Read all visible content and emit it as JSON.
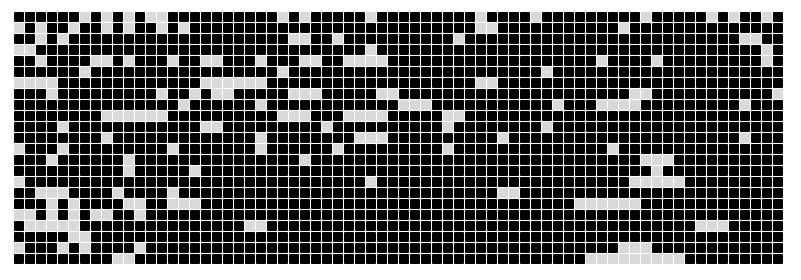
{
  "board": {
    "columns": 70,
    "rows": 23,
    "cell_size_px": 10,
    "gap_px": 1,
    "colors": {
      "on": "#000000",
      "off": "#d9d9d9",
      "background": "#ffffff"
    },
    "cells": [
      "1111110101010011111111110101111101111111110111101111111110111110101101",
      "0101101101011010111111111111111111111111110011111111111011111111111111",
      "1101011111111111111111111001101111111111011111111111111111111111110011",
      "0011111111111111111111111111111101111111111111111111111111111111111101",
      "1101111001011101100111011100110000111111111111111111101111011111111101",
      "1111110111111111111111110111111111111111111111110111111111111111111111",
      "0000111111111111100000011111111111111111110011111111111111111111111111",
      "1110111111111011010011111000111110011111111111111111111100111111111110",
      "1111111111111110111111011111111111100011111111111011100001111111110111",
      "1111111100000011111111110001110000111110011111111111111111111111111111",
      "1111011111111111100111111111011111111110111111110111111111111111111111",
      "1111111101111111111111011111111000111111111101111111111111111111110111",
      "0111011111111101111111011111101111111110111111111111110111111111111111",
      "1110111111011111111111111101111111111111111111111111111110001111111111",
      "1111111111011111011111111111111111111111111111111111111111011111111111",
      "0111111111111111111111111111111101111111111111111111111100000111111111",
      "1100011110111101111111111111111111111111111100111111111111111111111111",
      "1110101111001100011111111111111111111111111111111110000001111111111111",
      "0010101001101111111111111111111111111111111111111111111111111111111111",
      "1000001111111111111110011111111111111111111111111111111111111100011111",
      "1111100111111111111111111111111111111111111111111111111111111111111111",
      "0111010111101111111111111111111111111111111111111111111000111111111111",
      "1111111110011111111111111111111111111111111111111111000000000111111111"
    ]
  }
}
